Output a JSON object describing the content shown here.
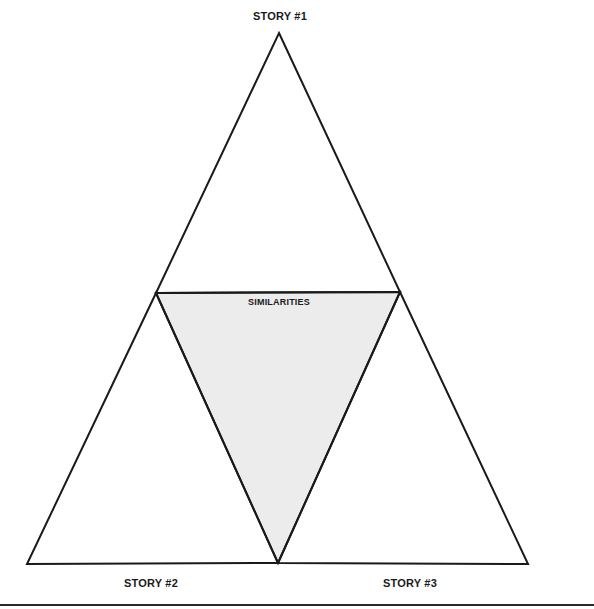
{
  "diagram": {
    "type": "comparison-triangle",
    "labels": {
      "top": "STORY #1",
      "center": "SIMILARITIES",
      "bottom_left": "STORY #2",
      "bottom_right": "STORY #3"
    },
    "colors": {
      "stroke": "#1a1a1a",
      "center_fill": "#ececec",
      "background": "#ffffff",
      "bottom_rule": "#2a2a2a"
    },
    "regions": [
      {
        "id": "story-1",
        "label": "STORY #1",
        "position": "top"
      },
      {
        "id": "similarities",
        "label": "SIMILARITIES",
        "position": "center",
        "shaded": true
      },
      {
        "id": "story-2",
        "label": "STORY #2",
        "position": "bottom-left"
      },
      {
        "id": "story-3",
        "label": "STORY #3",
        "position": "bottom-right"
      }
    ]
  }
}
